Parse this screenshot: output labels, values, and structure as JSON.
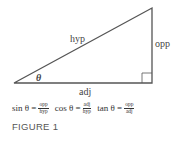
{
  "diagram": {
    "labels": {
      "hypotenuse": "hyp",
      "opposite": "opp",
      "adjacent": "adj",
      "angle": "θ"
    }
  },
  "formulas": [
    {
      "fn": "sin θ =",
      "num": "opp",
      "den": "hyp"
    },
    {
      "fn": "cos θ =",
      "num": "adj",
      "den": "hyp"
    },
    {
      "fn": "tan θ =",
      "num": "opp",
      "den": "adj"
    }
  ],
  "caption": "FIGURE 1",
  "colors": {
    "stroke": "#555555",
    "text": "#444444"
  }
}
